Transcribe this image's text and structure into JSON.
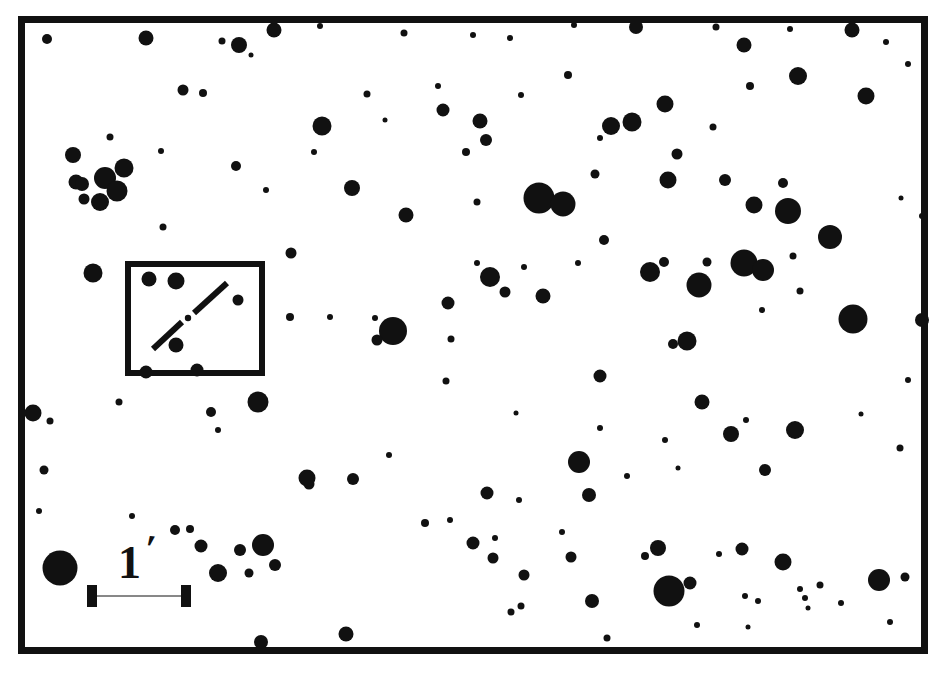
{
  "figure": {
    "kind": "astronomical-finder-chart",
    "background_color": "#ffffff",
    "ink_color": "#111111"
  },
  "frame": {
    "name": "chart-border",
    "x": 18,
    "y": 16,
    "width": 910,
    "height": 638,
    "stroke_width": 7,
    "color": "#111111"
  },
  "inset_box": {
    "name": "detail-inset-box",
    "x": 125,
    "y": 261,
    "width": 140,
    "height": 115,
    "stroke_width": 6,
    "color": "#111111",
    "marker": {
      "type": "broken-diagonal-line",
      "label": "target-position-marker",
      "segments": [
        {
          "x1": 153,
          "y1": 349,
          "x2": 182,
          "y2": 322
        },
        {
          "x1": 194,
          "y1": 313,
          "x2": 227,
          "y2": 283
        }
      ],
      "center_dot": {
        "cx": 188,
        "cy": 318,
        "r": 3.2
      },
      "stroke_width": 6
    },
    "stars": [
      {
        "cx": 149,
        "cy": 279,
        "r": 7.5
      },
      {
        "cx": 176,
        "cy": 281,
        "r": 8.5
      },
      {
        "cx": 238,
        "cy": 300,
        "r": 5.5
      },
      {
        "cx": 176,
        "cy": 345,
        "r": 7.5
      },
      {
        "cx": 146,
        "cy": 372,
        "r": 6.5
      },
      {
        "cx": 197,
        "cy": 370,
        "r": 6.5
      }
    ]
  },
  "scale_bar": {
    "name": "scale-bar",
    "value": "1",
    "unit_symbol": "′",
    "unit_name": "arcminute",
    "label": "1′",
    "bar": {
      "x1": 92,
      "y1": 596,
      "x2": 186,
      "y2": 596,
      "thickness": 9
    },
    "cap_height": 22,
    "cap_thickness": 10,
    "color": "#111111"
  },
  "chart_data": {
    "type": "scatter",
    "title": "",
    "subtitle": "",
    "xlabel": "",
    "ylabel": "",
    "grid": false,
    "legend": null,
    "xlim": [
      18,
      928
    ],
    "ylim": [
      16,
      654
    ],
    "point_unit": "pixels",
    "marker_shape": "filled-circle",
    "marker_color": "#111111",
    "note": "Each point is a star-like blob; r is the drawn radius in pixels.",
    "points": [
      {
        "cx": 47,
        "cy": 39,
        "r": 5.0
      },
      {
        "cx": 146,
        "cy": 38,
        "r": 7.5
      },
      {
        "cx": 222,
        "cy": 41,
        "r": 3.5
      },
      {
        "cx": 239,
        "cy": 45,
        "r": 8.0
      },
      {
        "cx": 274,
        "cy": 30,
        "r": 7.5
      },
      {
        "cx": 320,
        "cy": 26,
        "r": 3.0
      },
      {
        "cx": 404,
        "cy": 33,
        "r": 3.5
      },
      {
        "cx": 473,
        "cy": 35,
        "r": 3.0
      },
      {
        "cx": 510,
        "cy": 38,
        "r": 3.0
      },
      {
        "cx": 574,
        "cy": 25,
        "r": 3.0
      },
      {
        "cx": 636,
        "cy": 27,
        "r": 7.0
      },
      {
        "cx": 716,
        "cy": 27,
        "r": 3.5
      },
      {
        "cx": 744,
        "cy": 45,
        "r": 7.5
      },
      {
        "cx": 790,
        "cy": 29,
        "r": 3.0
      },
      {
        "cx": 852,
        "cy": 30,
        "r": 7.5
      },
      {
        "cx": 886,
        "cy": 42,
        "r": 3.0
      },
      {
        "cx": 183,
        "cy": 90,
        "r": 5.5
      },
      {
        "cx": 203,
        "cy": 93,
        "r": 4.0
      },
      {
        "cx": 251,
        "cy": 55,
        "r": 2.5
      },
      {
        "cx": 322,
        "cy": 126,
        "r": 9.5
      },
      {
        "cx": 367,
        "cy": 94,
        "r": 3.5
      },
      {
        "cx": 385,
        "cy": 120,
        "r": 2.5
      },
      {
        "cx": 438,
        "cy": 86,
        "r": 3.0
      },
      {
        "cx": 443,
        "cy": 110,
        "r": 6.5
      },
      {
        "cx": 480,
        "cy": 121,
        "r": 7.5
      },
      {
        "cx": 486,
        "cy": 140,
        "r": 6.0
      },
      {
        "cx": 521,
        "cy": 95,
        "r": 3.0
      },
      {
        "cx": 568,
        "cy": 75,
        "r": 4.0
      },
      {
        "cx": 600,
        "cy": 138,
        "r": 3.0
      },
      {
        "cx": 611,
        "cy": 126,
        "r": 9.0
      },
      {
        "cx": 632,
        "cy": 122,
        "r": 9.5
      },
      {
        "cx": 665,
        "cy": 104,
        "r": 8.5
      },
      {
        "cx": 713,
        "cy": 127,
        "r": 3.5
      },
      {
        "cx": 750,
        "cy": 86,
        "r": 4.0
      },
      {
        "cx": 798,
        "cy": 76,
        "r": 9.0
      },
      {
        "cx": 866,
        "cy": 96,
        "r": 8.5
      },
      {
        "cx": 908,
        "cy": 64,
        "r": 3.0
      },
      {
        "cx": 73,
        "cy": 155,
        "r": 8.0
      },
      {
        "cx": 76,
        "cy": 182,
        "r": 7.5
      },
      {
        "cx": 82,
        "cy": 184,
        "r": 7.0
      },
      {
        "cx": 105,
        "cy": 178,
        "r": 11.0
      },
      {
        "cx": 117,
        "cy": 191,
        "r": 10.5
      },
      {
        "cx": 100,
        "cy": 202,
        "r": 9.0
      },
      {
        "cx": 84,
        "cy": 199,
        "r": 5.5
      },
      {
        "cx": 124,
        "cy": 168,
        "r": 9.5
      },
      {
        "cx": 110,
        "cy": 137,
        "r": 3.5
      },
      {
        "cx": 161,
        "cy": 151,
        "r": 3.0
      },
      {
        "cx": 163,
        "cy": 227,
        "r": 3.5
      },
      {
        "cx": 236,
        "cy": 166,
        "r": 5.0
      },
      {
        "cx": 266,
        "cy": 190,
        "r": 3.0
      },
      {
        "cx": 314,
        "cy": 152,
        "r": 3.0
      },
      {
        "cx": 352,
        "cy": 188,
        "r": 8.0
      },
      {
        "cx": 406,
        "cy": 215,
        "r": 7.5
      },
      {
        "cx": 466,
        "cy": 152,
        "r": 4.0
      },
      {
        "cx": 477,
        "cy": 202,
        "r": 3.5
      },
      {
        "cx": 539,
        "cy": 198,
        "r": 15.5
      },
      {
        "cx": 563,
        "cy": 204,
        "r": 12.5
      },
      {
        "cx": 595,
        "cy": 174,
        "r": 4.5
      },
      {
        "cx": 604,
        "cy": 240,
        "r": 5.0
      },
      {
        "cx": 668,
        "cy": 180,
        "r": 8.5
      },
      {
        "cx": 677,
        "cy": 154,
        "r": 5.5
      },
      {
        "cx": 725,
        "cy": 180,
        "r": 6.0
      },
      {
        "cx": 754,
        "cy": 205,
        "r": 8.5
      },
      {
        "cx": 783,
        "cy": 183,
        "r": 5.0
      },
      {
        "cx": 788,
        "cy": 211,
        "r": 13.0
      },
      {
        "cx": 830,
        "cy": 237,
        "r": 12.0
      },
      {
        "cx": 901,
        "cy": 198,
        "r": 2.5
      },
      {
        "cx": 922,
        "cy": 216,
        "r": 3.0
      },
      {
        "cx": 93,
        "cy": 273,
        "r": 9.5
      },
      {
        "cx": 291,
        "cy": 253,
        "r": 5.5
      },
      {
        "cx": 290,
        "cy": 317,
        "r": 4.0
      },
      {
        "cx": 330,
        "cy": 317,
        "r": 3.0
      },
      {
        "cx": 375,
        "cy": 318,
        "r": 3.0
      },
      {
        "cx": 393,
        "cy": 331,
        "r": 14.0
      },
      {
        "cx": 377,
        "cy": 340,
        "r": 5.5
      },
      {
        "cx": 448,
        "cy": 303,
        "r": 6.5
      },
      {
        "cx": 451,
        "cy": 339,
        "r": 3.5
      },
      {
        "cx": 490,
        "cy": 277,
        "r": 10.0
      },
      {
        "cx": 505,
        "cy": 292,
        "r": 5.5
      },
      {
        "cx": 524,
        "cy": 267,
        "r": 3.0
      },
      {
        "cx": 477,
        "cy": 263,
        "r": 3.0
      },
      {
        "cx": 543,
        "cy": 296,
        "r": 7.5
      },
      {
        "cx": 578,
        "cy": 263,
        "r": 3.0
      },
      {
        "cx": 600,
        "cy": 376,
        "r": 6.5
      },
      {
        "cx": 650,
        "cy": 272,
        "r": 10.0
      },
      {
        "cx": 664,
        "cy": 262,
        "r": 5.0
      },
      {
        "cx": 673,
        "cy": 344,
        "r": 5.0
      },
      {
        "cx": 687,
        "cy": 341,
        "r": 9.5
      },
      {
        "cx": 699,
        "cy": 285,
        "r": 12.5
      },
      {
        "cx": 707,
        "cy": 262,
        "r": 4.5
      },
      {
        "cx": 744,
        "cy": 263,
        "r": 13.5
      },
      {
        "cx": 763,
        "cy": 270,
        "r": 11.0
      },
      {
        "cx": 762,
        "cy": 310,
        "r": 3.0
      },
      {
        "cx": 793,
        "cy": 256,
        "r": 3.5
      },
      {
        "cx": 800,
        "cy": 291,
        "r": 3.5
      },
      {
        "cx": 853,
        "cy": 319,
        "r": 14.5
      },
      {
        "cx": 922,
        "cy": 320,
        "r": 7.0
      },
      {
        "cx": 446,
        "cy": 381,
        "r": 3.5
      },
      {
        "cx": 33,
        "cy": 413,
        "r": 8.5
      },
      {
        "cx": 50,
        "cy": 421,
        "r": 3.5
      },
      {
        "cx": 44,
        "cy": 470,
        "r": 4.5
      },
      {
        "cx": 119,
        "cy": 402,
        "r": 3.5
      },
      {
        "cx": 211,
        "cy": 412,
        "r": 5.0
      },
      {
        "cx": 258,
        "cy": 402,
        "r": 10.5
      },
      {
        "cx": 218,
        "cy": 430,
        "r": 3.0
      },
      {
        "cx": 353,
        "cy": 479,
        "r": 6.0
      },
      {
        "cx": 309,
        "cy": 484,
        "r": 5.5
      },
      {
        "cx": 389,
        "cy": 455,
        "r": 3.0
      },
      {
        "cx": 487,
        "cy": 493,
        "r": 6.5
      },
      {
        "cx": 519,
        "cy": 500,
        "r": 3.0
      },
      {
        "cx": 516,
        "cy": 413,
        "r": 2.5
      },
      {
        "cx": 579,
        "cy": 462,
        "r": 11.0
      },
      {
        "cx": 600,
        "cy": 428,
        "r": 3.0
      },
      {
        "cx": 589,
        "cy": 495,
        "r": 7.0
      },
      {
        "cx": 627,
        "cy": 476,
        "r": 3.0
      },
      {
        "cx": 665,
        "cy": 440,
        "r": 3.0
      },
      {
        "cx": 678,
        "cy": 468,
        "r": 2.5
      },
      {
        "cx": 702,
        "cy": 402,
        "r": 7.5
      },
      {
        "cx": 731,
        "cy": 434,
        "r": 8.0
      },
      {
        "cx": 746,
        "cy": 420,
        "r": 3.0
      },
      {
        "cx": 795,
        "cy": 430,
        "r": 9.0
      },
      {
        "cx": 765,
        "cy": 470,
        "r": 6.0
      },
      {
        "cx": 861,
        "cy": 414,
        "r": 2.5
      },
      {
        "cx": 900,
        "cy": 448,
        "r": 3.5
      },
      {
        "cx": 908,
        "cy": 380,
        "r": 3.0
      },
      {
        "cx": 39,
        "cy": 511,
        "r": 3.0
      },
      {
        "cx": 60,
        "cy": 568,
        "r": 17.5
      },
      {
        "cx": 132,
        "cy": 516,
        "r": 3.0
      },
      {
        "cx": 175,
        "cy": 530,
        "r": 5.0
      },
      {
        "cx": 190,
        "cy": 529,
        "r": 4.0
      },
      {
        "cx": 201,
        "cy": 546,
        "r": 6.5
      },
      {
        "cx": 218,
        "cy": 573,
        "r": 9.0
      },
      {
        "cx": 240,
        "cy": 550,
        "r": 6.0
      },
      {
        "cx": 263,
        "cy": 545,
        "r": 11.0
      },
      {
        "cx": 249,
        "cy": 573,
        "r": 4.5
      },
      {
        "cx": 275,
        "cy": 565,
        "r": 6.0
      },
      {
        "cx": 261,
        "cy": 642,
        "r": 7.0
      },
      {
        "cx": 307,
        "cy": 478,
        "r": 8.5
      },
      {
        "cx": 346,
        "cy": 634,
        "r": 7.5
      },
      {
        "cx": 425,
        "cy": 523,
        "r": 4.0
      },
      {
        "cx": 450,
        "cy": 520,
        "r": 3.0
      },
      {
        "cx": 473,
        "cy": 543,
        "r": 6.5
      },
      {
        "cx": 493,
        "cy": 558,
        "r": 5.5
      },
      {
        "cx": 495,
        "cy": 538,
        "r": 3.0
      },
      {
        "cx": 524,
        "cy": 575,
        "r": 5.5
      },
      {
        "cx": 511,
        "cy": 612,
        "r": 3.5
      },
      {
        "cx": 521,
        "cy": 606,
        "r": 3.5
      },
      {
        "cx": 562,
        "cy": 532,
        "r": 3.0
      },
      {
        "cx": 571,
        "cy": 557,
        "r": 5.5
      },
      {
        "cx": 592,
        "cy": 601,
        "r": 7.0
      },
      {
        "cx": 607,
        "cy": 638,
        "r": 3.5
      },
      {
        "cx": 645,
        "cy": 556,
        "r": 4.0
      },
      {
        "cx": 669,
        "cy": 591,
        "r": 15.5
      },
      {
        "cx": 690,
        "cy": 583,
        "r": 6.5
      },
      {
        "cx": 658,
        "cy": 548,
        "r": 8.0
      },
      {
        "cx": 697,
        "cy": 625,
        "r": 3.0
      },
      {
        "cx": 719,
        "cy": 554,
        "r": 3.0
      },
      {
        "cx": 742,
        "cy": 549,
        "r": 6.5
      },
      {
        "cx": 745,
        "cy": 596,
        "r": 3.0
      },
      {
        "cx": 758,
        "cy": 601,
        "r": 3.0
      },
      {
        "cx": 783,
        "cy": 562,
        "r": 8.5
      },
      {
        "cx": 800,
        "cy": 589,
        "r": 3.0
      },
      {
        "cx": 805,
        "cy": 598,
        "r": 3.0
      },
      {
        "cx": 808,
        "cy": 608,
        "r": 2.5
      },
      {
        "cx": 820,
        "cy": 585,
        "r": 3.5
      },
      {
        "cx": 841,
        "cy": 603,
        "r": 3.0
      },
      {
        "cx": 879,
        "cy": 580,
        "r": 11.0
      },
      {
        "cx": 905,
        "cy": 577,
        "r": 4.5
      },
      {
        "cx": 890,
        "cy": 622,
        "r": 3.0
      },
      {
        "cx": 748,
        "cy": 627,
        "r": 2.5
      }
    ]
  }
}
